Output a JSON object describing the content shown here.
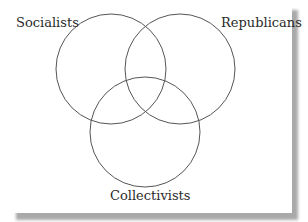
{
  "diagram": {
    "type": "venn",
    "sets": [
      {
        "label": "Socialists",
        "cx": 111,
        "cy": 69,
        "r": 55
      },
      {
        "label": "Republicans",
        "cx": 180,
        "cy": 69,
        "r": 55
      },
      {
        "label": "Collectivists",
        "cx": 145,
        "cy": 132,
        "r": 55
      }
    ],
    "stroke_color": "#555555",
    "background": "#ffffff",
    "shadow_color": "#a9a9a9"
  }
}
